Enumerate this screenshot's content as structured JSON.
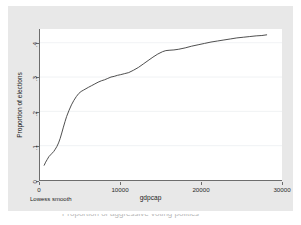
{
  "figure": {
    "background_color": "#e8e8e8",
    "plot_background_color": "#ffffff",
    "footnote": "Lowess smooth",
    "caption": "Proportion of aggressive voting politics"
  },
  "chart_data": {
    "type": "line",
    "title": "",
    "subtitle": "",
    "xlabel": "gdpcap",
    "ylabel": "Proportion of elections",
    "xlim": [
      0,
      30000
    ],
    "ylim": [
      0,
      0.44
    ],
    "grid": true,
    "grid_axis": "y",
    "legend": null,
    "legend_position": "none",
    "annotations": [
      "Lowess smooth"
    ],
    "xticks": [
      0,
      10000,
      20000,
      30000
    ],
    "xticklabels": [
      "0",
      "10000",
      "20000",
      "30000"
    ],
    "yticks": [
      0,
      0.1,
      0.2,
      0.3,
      0.4
    ],
    "yticklabels": [
      "0",
      ".1",
      ".2",
      ".3",
      ".4"
    ],
    "line_color": "#3a3a3a",
    "series": [
      {
        "name": "Lowess smooth",
        "x": [
          520,
          700,
          900,
          1100,
          1300,
          1500,
          1700,
          1900,
          2100,
          2300,
          2500,
          2700,
          2900,
          3100,
          3300,
          3600,
          3900,
          4200,
          4500,
          4800,
          5100,
          5400,
          5700,
          6000,
          6400,
          6800,
          7200,
          7600,
          8000,
          8400,
          8800,
          9200,
          9600,
          10000,
          10500,
          11000,
          11600,
          12200,
          12800,
          13400,
          14000,
          14600,
          15200,
          15600,
          16000,
          16600,
          17200,
          18000,
          18800,
          19600,
          20400,
          21200,
          22000,
          22800,
          23600,
          24400,
          25200,
          26000,
          26800,
          27500,
          28100
        ],
        "y": [
          0.043,
          0.052,
          0.06,
          0.068,
          0.073,
          0.078,
          0.083,
          0.09,
          0.098,
          0.108,
          0.121,
          0.137,
          0.154,
          0.17,
          0.185,
          0.203,
          0.219,
          0.232,
          0.243,
          0.252,
          0.258,
          0.262,
          0.266,
          0.27,
          0.275,
          0.28,
          0.285,
          0.289,
          0.292,
          0.296,
          0.3,
          0.302,
          0.305,
          0.307,
          0.31,
          0.313,
          0.32,
          0.328,
          0.338,
          0.348,
          0.358,
          0.367,
          0.374,
          0.377,
          0.378,
          0.379,
          0.381,
          0.385,
          0.39,
          0.394,
          0.398,
          0.402,
          0.405,
          0.408,
          0.411,
          0.414,
          0.416,
          0.418,
          0.42,
          0.421,
          0.423
        ]
      }
    ]
  }
}
